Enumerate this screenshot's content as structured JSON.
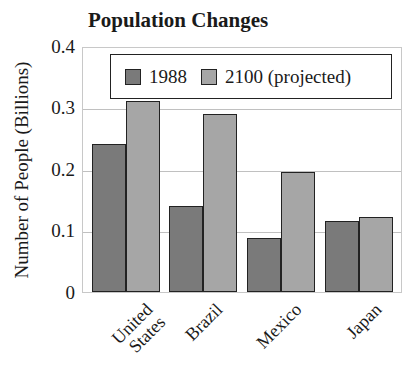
{
  "chart_data": {
    "type": "bar",
    "title": "Population Changes",
    "xlabel": "",
    "ylabel": "Number of People (Billions)",
    "ylim": [
      0,
      0.4
    ],
    "yticks": [
      "0",
      "0.1",
      "0.2",
      "0.3",
      "0.4"
    ],
    "grid": true,
    "legend_position": "top-inside",
    "categories": [
      "United States",
      "Brazil",
      "Mexico",
      "Japan"
    ],
    "series": [
      {
        "name": "1988",
        "color": "#7a7a7a",
        "values": [
          0.24,
          0.14,
          0.088,
          0.115
        ]
      },
      {
        "name": "2100 (projected)",
        "color": "#a6a6a6",
        "values": [
          0.31,
          0.29,
          0.195,
          0.122
        ]
      }
    ]
  },
  "labels": {
    "title": "Population Changes",
    "ylabel": "Number of People (Billions)",
    "yticks": [
      "0",
      "0.1",
      "0.2",
      "0.3",
      "0.4"
    ],
    "legend": [
      "1988",
      "2100 (projected)"
    ],
    "categories": [
      "United\nStates",
      "Brazil",
      "Mexico",
      "Japan"
    ]
  }
}
